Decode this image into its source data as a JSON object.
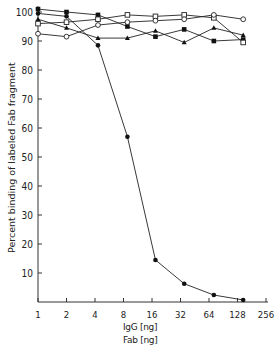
{
  "chart_data": {
    "type": "line",
    "title": "",
    "xlabel": [
      "IgG [ng]",
      "Fab [ng]"
    ],
    "ylabel": "Percent binding of labeled Fab fragment",
    "x_scale": "log2",
    "xlim": [
      1,
      256
    ],
    "ylim": [
      0,
      100
    ],
    "x_ticks": [
      1,
      2,
      4,
      8,
      16,
      32,
      64,
      128,
      256
    ],
    "y_ticks": [
      10,
      20,
      30,
      40,
      50,
      60,
      70,
      80,
      90,
      100
    ],
    "grid": false,
    "legend": null,
    "series": [
      {
        "name": "filled-circle (falling)",
        "marker": "filled-circle",
        "points": [
          [
            1,
            99.5
          ],
          [
            2,
            98.5
          ],
          [
            4.3,
            88.5
          ],
          [
            8.8,
            57
          ],
          [
            17.4,
            14.5
          ],
          [
            35,
            6.3
          ],
          [
            72,
            2.4
          ],
          [
            147,
            0.7
          ]
        ]
      },
      {
        "name": "filled-square",
        "marker": "filled-square",
        "points": [
          [
            1,
            101
          ],
          [
            2,
            100
          ],
          [
            4.3,
            99
          ],
          [
            8.8,
            95
          ],
          [
            17.4,
            91.5
          ],
          [
            35,
            94
          ],
          [
            72,
            90
          ],
          [
            147,
            90.5
          ]
        ]
      },
      {
        "name": "filled-triangle",
        "marker": "filled-triangle",
        "points": [
          [
            1,
            97.5
          ],
          [
            2,
            94.5
          ],
          [
            4.3,
            91
          ],
          [
            8.8,
            91
          ],
          [
            17.4,
            93.5
          ],
          [
            35,
            89.5
          ],
          [
            72,
            94.5
          ],
          [
            147,
            92
          ]
        ]
      },
      {
        "name": "open-square",
        "marker": "open-square",
        "points": [
          [
            1,
            96
          ],
          [
            2,
            96.5
          ],
          [
            4.3,
            97.5
          ],
          [
            8.8,
            99
          ],
          [
            17.4,
            98.5
          ],
          [
            35,
            99
          ],
          [
            72,
            98
          ],
          [
            147,
            89.5
          ]
        ]
      },
      {
        "name": "open-circle",
        "marker": "open-circle",
        "points": [
          [
            1,
            92.5
          ],
          [
            2,
            91.5
          ],
          [
            4.3,
            95.5
          ],
          [
            8.8,
            96.5
          ],
          [
            17.4,
            97
          ],
          [
            35,
            97.5
          ],
          [
            72,
            99
          ],
          [
            147,
            97.5
          ]
        ]
      }
    ]
  },
  "labels": {
    "ylabel": "Percent binding of labeled Fab fragment",
    "xlabel_1": "IgG [ng]",
    "xlabel_2": "Fab [ng]"
  }
}
